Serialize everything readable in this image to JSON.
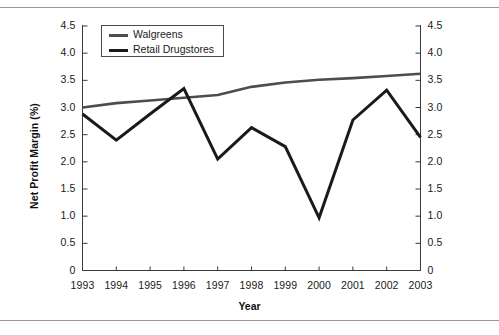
{
  "chart_data": {
    "type": "line",
    "title": "",
    "xlabel": "Year",
    "ylabel": "Net Profit Margin (%)",
    "categories": [
      "1993",
      "1994",
      "1995",
      "1996",
      "1997",
      "1998",
      "1999",
      "2000",
      "2001",
      "2002",
      "2003"
    ],
    "x": [
      1993,
      1994,
      1995,
      1996,
      1997,
      1998,
      1999,
      2000,
      2001,
      2002,
      2003
    ],
    "ylim": [
      0,
      4.5
    ],
    "yticks": [
      "0",
      "0.5",
      "1.0",
      "1.5",
      "2.0",
      "2.5",
      "3.0",
      "3.5",
      "4.0",
      "4.5"
    ],
    "ytick_values": [
      0,
      0.5,
      1.0,
      1.5,
      2.0,
      2.5,
      3.0,
      3.5,
      4.0,
      4.5
    ],
    "yticks_right": [
      "0",
      "0.5",
      "1.0",
      "1.5",
      "2.0",
      "2.5",
      "3.0",
      "3.5",
      "4.0",
      "4.5"
    ],
    "grid": false,
    "legend_position": "top-left",
    "series": [
      {
        "name": "Walgreens",
        "color": "#4d4d4d",
        "line_width": 2.6,
        "values": [
          3.0,
          3.08,
          3.13,
          3.18,
          3.23,
          3.38,
          3.46,
          3.51,
          3.54,
          3.58,
          3.62
        ]
      },
      {
        "name": "Retail Drugstores",
        "color": "#1a1a1a",
        "line_width": 3.0,
        "values": [
          2.88,
          2.4,
          2.88,
          3.35,
          2.05,
          2.63,
          2.28,
          0.97,
          2.77,
          3.32,
          2.45
        ]
      }
    ]
  },
  "axes": {
    "y_axis_label": "Net Profit Margin (%)",
    "x_axis_label": "Year"
  },
  "legend": {
    "entries": [
      {
        "label": "Walgreens"
      },
      {
        "label": "Retail Drugstores"
      }
    ]
  },
  "colors": {
    "walgreens": "#4d4d4d",
    "retail_drugstores": "#1a1a1a",
    "axis": "#3a3a3a",
    "rule": "#9a9a9a",
    "background": "#ffffff"
  }
}
